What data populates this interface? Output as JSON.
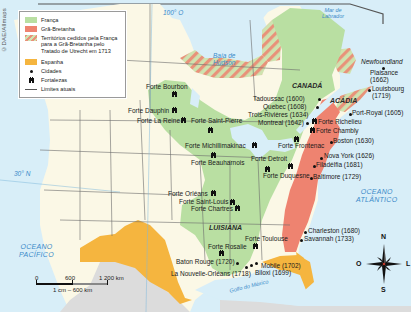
{
  "credit": "©DAE/Allmaps",
  "colors": {
    "franca": "#b9dfa2",
    "gra_bretanha": "#ee8370",
    "cedidos_stripe_a": "#e8927a",
    "cedidos_stripe_b": "#cfe3b0",
    "espanha": "#f5b53f",
    "land_other": "#fbf8e6",
    "mexico_gray": "#dcdcdc",
    "water": "#d8eef8",
    "water_label": "#3a8ac8"
  },
  "legend": {
    "items": [
      {
        "id": "franca",
        "label": "França",
        "type": "swatch"
      },
      {
        "id": "gra_bretanha",
        "label": "Grã-Bretanha",
        "type": "swatch"
      },
      {
        "id": "cedidos",
        "label": "Territórios cedidos pela França para a Grã-Bretanha pelo Tratado de Utrecht em 1713",
        "type": "hatch"
      },
      {
        "id": "espanha",
        "label": "Espanha",
        "type": "swatch"
      },
      {
        "id": "cidades",
        "label": "Cidades",
        "type": "dot"
      },
      {
        "id": "fortalezas",
        "label": "Fortalezas",
        "type": "fort"
      },
      {
        "id": "limites",
        "label": "Limites atuais",
        "type": "line"
      }
    ]
  },
  "water_labels": {
    "baia_hudson": "Baía de\nHudson",
    "mar_labrador": "Mar de\nLabrador",
    "golfo_mexico": "Golfo do México",
    "oceano_atlantico": "OCEANO\nATLÂNTICO",
    "oceano_pacifico": "OCEANO\nPACÍFICO"
  },
  "regions": {
    "canada": "CANADÁ",
    "acadia": "ACÁDIA",
    "luisiana": "LUISIANA",
    "newfoundland": "Newfoundland"
  },
  "graticule": {
    "lon_100": "100° O",
    "lat_30": "30° N"
  },
  "cities": [
    {
      "name": "Plaisance\n(1662)",
      "x": 345,
      "y": 72
    },
    {
      "name": "Louisbourg\n(1719)",
      "x": 370,
      "y": 90
    },
    {
      "name": "Tadoussac (1600)",
      "x": 317,
      "y": 97
    },
    {
      "name": "Quebec (1608)",
      "x": 316,
      "y": 106
    },
    {
      "name": "Trois-Rivières (1634)",
      "x": 312,
      "y": 115
    },
    {
      "name": "Montreal (1642)",
      "x": 308,
      "y": 123
    },
    {
      "name": "Port-Royal (1605)",
      "x": 352,
      "y": 114
    },
    {
      "name": "Boston (1630)",
      "x": 331,
      "y": 142
    },
    {
      "name": "Nova York (1626)",
      "x": 322,
      "y": 157
    },
    {
      "name": "Filadélfia (1681)",
      "x": 314,
      "y": 166
    },
    {
      "name": "Baltimore (1729)",
      "x": 310,
      "y": 177
    },
    {
      "name": "Charleston (1680)",
      "x": 304,
      "y": 231
    },
    {
      "name": "Savannah (1733)",
      "x": 300,
      "y": 239
    },
    {
      "name": "Mobile (1702)",
      "x": 256,
      "y": 264
    },
    {
      "name": "Biloxi (1699)",
      "x": 249,
      "y": 267
    },
    {
      "name": "Baton Rouge (1720)",
      "x": 236,
      "y": 262
    },
    {
      "name": "La Nouvelle-Orléans (1718)",
      "x": 245,
      "y": 270
    }
  ],
  "forts": [
    {
      "name": "Forte Bourbon",
      "x": 172,
      "y": 92
    },
    {
      "name": "Forte Dauphin",
      "x": 172,
      "y": 108
    },
    {
      "name": "Forte La Reine",
      "x": 181,
      "y": 118
    },
    {
      "name": "Forte Saint-Pierre",
      "x": 205,
      "y": 127
    },
    {
      "name": "Forte Michillimakinac",
      "x": 243,
      "y": 143
    },
    {
      "name": "Forte Beauharnois",
      "x": 213,
      "y": 155
    },
    {
      "name": "Forte Detroit",
      "x": 266,
      "y": 167
    },
    {
      "name": "Forte Duquesne",
      "x": 288,
      "y": 163
    },
    {
      "name": "Forte Frontenac",
      "x": 295,
      "y": 140
    },
    {
      "name": "Forte Richelieu",
      "x": 314,
      "y": 117
    },
    {
      "name": "Forte Chambly",
      "x": 312,
      "y": 128
    },
    {
      "name": "Forte Orléans",
      "x": 212,
      "y": 191
    },
    {
      "name": "Forte Saint-Louis",
      "x": 230,
      "y": 201
    },
    {
      "name": "Forte Chartres",
      "x": 234,
      "y": 206
    },
    {
      "name": "Forte Rosalie",
      "x": 220,
      "y": 250
    },
    {
      "name": "Forte Toulouse",
      "x": 258,
      "y": 244
    }
  ],
  "scale": {
    "ticks": [
      "0",
      "600",
      "1 200 km"
    ],
    "ratio": "1 cm – 600 km"
  },
  "compass": {
    "n": "N",
    "s": "S",
    "o": "O",
    "l": "L"
  }
}
